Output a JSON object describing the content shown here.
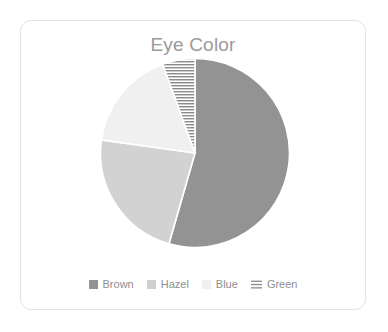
{
  "card": {
    "background": "#ffffff",
    "border_color": "#e3e3e3"
  },
  "chart_data": {
    "type": "pie",
    "title": "Eye Color",
    "xlabel": "",
    "ylabel": "",
    "categories": [
      "Brown",
      "Hazel",
      "Blue",
      "Green"
    ],
    "values": [
      54.4,
      22.8,
      17.2,
      5.6
    ],
    "units": "percent",
    "start_angle_deg": 0,
    "direction": "clockwise",
    "legend_position": "bottom",
    "grid": false,
    "slices": [
      {
        "label": "Brown",
        "value": 54.4,
        "color": "#939393",
        "fill": "solid",
        "start_deg": 0,
        "end_deg": 196
      },
      {
        "label": "Hazel",
        "value": 22.8,
        "color": "#d2d2d2",
        "fill": "solid",
        "start_deg": 196,
        "end_deg": 278
      },
      {
        "label": "Blue",
        "value": 17.2,
        "color": "#f0f0f0",
        "fill": "solid",
        "start_deg": 278,
        "end_deg": 340
      },
      {
        "label": "Green",
        "value": 5.6,
        "color": "#8c8c8c",
        "fill": "horizontal-hatch",
        "start_deg": 340,
        "end_deg": 360
      }
    ]
  },
  "legend": {
    "items": [
      {
        "label": "Brown",
        "color": "#939393",
        "icon": "square-swatch-icon"
      },
      {
        "label": "Hazel",
        "color": "#cfcfcf",
        "icon": "square-swatch-icon"
      },
      {
        "label": "Blue",
        "color": "#f0f0f0",
        "icon": "square-swatch-icon"
      },
      {
        "label": "Green",
        "color": "#8c8c8c",
        "icon": "hatch-swatch-icon"
      }
    ]
  },
  "colors": {
    "title_text": "#9a9a9a",
    "legend_text": "#8e8e8e",
    "slice_separator": "#ffffff"
  }
}
